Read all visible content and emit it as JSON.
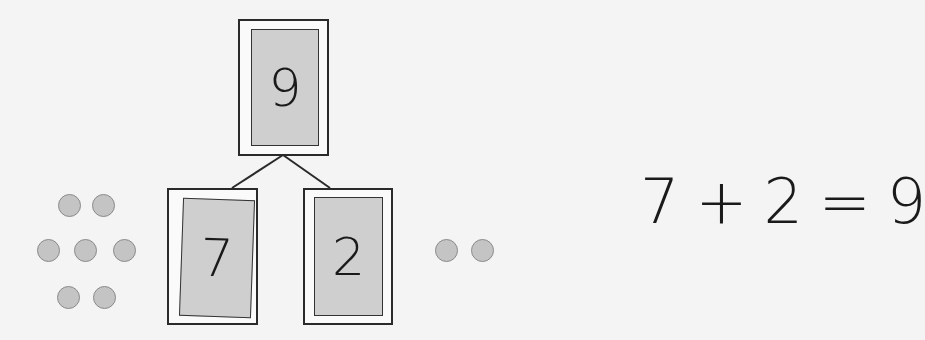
{
  "number_bond": {
    "whole": "9",
    "part_left": "7",
    "part_right": "2"
  },
  "counters": {
    "left_group_count": 7,
    "right_group_count": 2
  },
  "equation": {
    "addend1": "7",
    "plus": "+",
    "addend2": "2",
    "equals": "=",
    "sum": "9"
  },
  "colors": {
    "card_fill": "#cfcfcf",
    "counter_fill": "#c4c4c4",
    "line": "#2a2a2a"
  }
}
